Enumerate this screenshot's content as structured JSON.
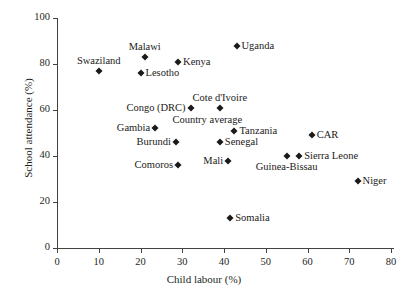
{
  "chart_data": {
    "type": "scatter",
    "title": "",
    "xlabel": "Child labour (%)",
    "ylabel": "School attendance (%)",
    "xlim": [
      0,
      80
    ],
    "ylim": [
      0,
      100
    ],
    "xticks": [
      0,
      10,
      20,
      30,
      40,
      50,
      60,
      70,
      80
    ],
    "yticks": [
      0,
      20,
      40,
      60,
      80,
      100
    ],
    "xticklabels": [
      "0",
      "10",
      "20",
      "30",
      "40",
      "50",
      "60",
      "70",
      "80"
    ],
    "yticklabels": [
      "0",
      "20",
      "40",
      "60",
      "80",
      "100"
    ],
    "grid": false,
    "legend": "none",
    "marker": "diamond",
    "marker_color": "#1c1a18",
    "points": [
      {
        "label": "Swaziland",
        "x": 10.0,
        "y": 77,
        "label_pos": "above"
      },
      {
        "label": "Malawi",
        "x": 21.0,
        "y": 83,
        "label_pos": "above"
      },
      {
        "label": "Kenya",
        "x": 29.0,
        "y": 81,
        "label_pos": "right"
      },
      {
        "label": "Lesotho",
        "x": 20.0,
        "y": 76,
        "label_pos": "right"
      },
      {
        "label": "Uganda",
        "x": 43.0,
        "y": 88,
        "label_pos": "right"
      },
      {
        "label": "Cote d'Ivoire",
        "x": 39.0,
        "y": 61,
        "label_pos": "above"
      },
      {
        "label": "Congo (DRC)",
        "x": 32.0,
        "y": 61,
        "label_pos": "left"
      },
      {
        "label": "Gambia",
        "x": 23.5,
        "y": 52,
        "label_pos": "left"
      },
      {
        "label": "Tanzania",
        "x": 42.5,
        "y": 51,
        "label_pos": "right"
      },
      {
        "label": "Senegal",
        "x": 39.0,
        "y": 46,
        "label_pos": "right"
      },
      {
        "label": "Burundi",
        "x": 28.5,
        "y": 46,
        "label_pos": "left"
      },
      {
        "label": "CAR",
        "x": 61.0,
        "y": 49,
        "label_pos": "right"
      },
      {
        "label": "Sierra Leone",
        "x": 58.0,
        "y": 40,
        "label_pos": "right"
      },
      {
        "label": "Guinea-Bissau",
        "x": 55.0,
        "y": 40,
        "label_pos": "below"
      },
      {
        "label": "Mali",
        "x": 41.0,
        "y": 38,
        "label_pos": "left"
      },
      {
        "label": "Comoros",
        "x": 29.0,
        "y": 36,
        "label_pos": "left"
      },
      {
        "label": "Niger",
        "x": 72.0,
        "y": 29,
        "label_pos": "right"
      },
      {
        "label": "Somalia",
        "x": 41.5,
        "y": 13,
        "label_pos": "right"
      }
    ],
    "annotations": [
      {
        "text": "Country average",
        "x": 36.0,
        "y": 56
      }
    ]
  }
}
